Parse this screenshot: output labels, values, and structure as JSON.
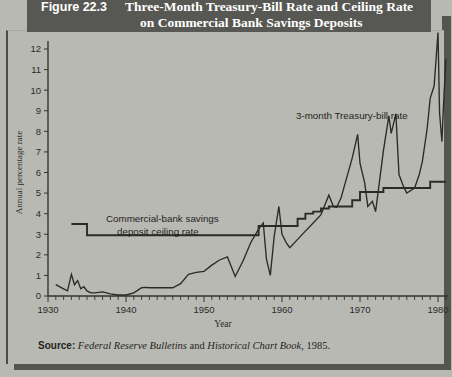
{
  "figure": {
    "number_label": "Figure 22.3",
    "title_line1": "Three-Month Treasury-Bill Rate and Ceiling Rate",
    "title_line2": "on Commercial Bank Savings Deposits",
    "banner_color": "#575753",
    "page_background": "#b9b9b4"
  },
  "source": {
    "label": "Source:",
    "italic1": "Federal Reserve Bulletins",
    "conjunction": " and ",
    "italic2": "Historical Chart Book",
    "tail": ", 1985."
  },
  "annotations": {
    "tbill": "3-month Treasury-bill rate",
    "ceiling_line1": "Commercial-bank savings",
    "ceiling_line2": "deposit ceiling rate"
  },
  "chart_data": {
    "type": "line",
    "title": "Three-Month Treasury-Bill Rate and Ceiling Rate on Commercial Bank Savings Deposits",
    "xlabel": "Year",
    "ylabel": "Annual percentage rate",
    "xlim": [
      1930,
      1981
    ],
    "ylim": [
      0,
      13
    ],
    "grid": false,
    "legend": "inline-annotations",
    "xticklabels": [
      "1930",
      "1940",
      "1950",
      "1960",
      "1970",
      "1980"
    ],
    "xtickvalues": [
      1930,
      1940,
      1950,
      1960,
      1970,
      1980
    ],
    "xtick_minor_step": 1,
    "yticklabels": [
      "0",
      "1",
      "2",
      "3",
      "4",
      "5",
      "6",
      "7",
      "8",
      "9",
      "10",
      "11",
      "12"
    ],
    "ytickvalues": [
      0,
      1,
      2,
      3,
      4,
      5,
      6,
      7,
      8,
      9,
      10,
      11,
      12
    ],
    "series": [
      {
        "name": "3-month Treasury-bill rate",
        "color": "#2b2b26",
        "x": [
          1931,
          1932,
          1932.5,
          1933,
          1933.4,
          1933.8,
          1934.2,
          1934.6,
          1935,
          1935.5,
          1936,
          1937,
          1938,
          1939,
          1940,
          1941,
          1942,
          1942.6,
          1943,
          1944,
          1945,
          1946,
          1947,
          1948,
          1949,
          1950,
          1951,
          1952,
          1953,
          1954,
          1955,
          1956,
          1957,
          1957.6,
          1958,
          1958.5,
          1959,
          1959.6,
          1960,
          1960.6,
          1961,
          1962,
          1963,
          1964,
          1965,
          1966,
          1966.6,
          1967,
          1967.6,
          1968,
          1969,
          1969.7,
          1970,
          1970.6,
          1971,
          1971.6,
          1972,
          1973,
          1973.7,
          1974,
          1974.6,
          1975,
          1975.6,
          1976,
          1977,
          1977.6,
          1978,
          1978.6,
          1979,
          1979.5,
          1980,
          1980.2,
          1980.5,
          1980.7,
          1981
        ],
        "y": [
          0.55,
          0.35,
          0.25,
          1.05,
          0.55,
          0.75,
          0.35,
          0.45,
          0.25,
          0.15,
          0.15,
          0.2,
          0.1,
          0.05,
          0.05,
          0.15,
          0.4,
          0.42,
          0.4,
          0.4,
          0.4,
          0.4,
          0.6,
          1.05,
          1.15,
          1.2,
          1.5,
          1.75,
          1.9,
          0.95,
          1.7,
          2.6,
          3.25,
          3.55,
          1.8,
          1.0,
          2.9,
          4.35,
          3.0,
          2.55,
          2.35,
          2.75,
          3.15,
          3.55,
          3.95,
          4.9,
          4.35,
          4.3,
          4.8,
          5.35,
          6.7,
          7.85,
          6.45,
          5.5,
          4.35,
          4.6,
          4.1,
          7.05,
          8.75,
          7.9,
          8.85,
          5.9,
          5.3,
          5.0,
          5.25,
          5.9,
          6.55,
          8.1,
          9.6,
          10.2,
          12.8,
          8.9,
          7.5,
          9.2,
          11.5
        ]
      },
      {
        "name": "Commercial-bank savings deposit ceiling rate",
        "color": "#2b2b26",
        "type": "step",
        "x": [
          1933,
          1935,
          1935,
          1957,
          1957,
          1962,
          1962,
          1963,
          1963,
          1964,
          1964,
          1965,
          1965,
          1966,
          1966,
          1969,
          1969,
          1970,
          1970,
          1973,
          1973,
          1979,
          1979,
          1981
        ],
        "y": [
          3.5,
          3.5,
          2.95,
          2.95,
          3.4,
          3.4,
          3.75,
          3.75,
          4.0,
          4.0,
          4.1,
          4.1,
          4.25,
          4.25,
          4.35,
          4.35,
          4.65,
          4.65,
          5.05,
          5.05,
          5.25,
          5.25,
          5.55,
          5.55
        ]
      }
    ]
  }
}
